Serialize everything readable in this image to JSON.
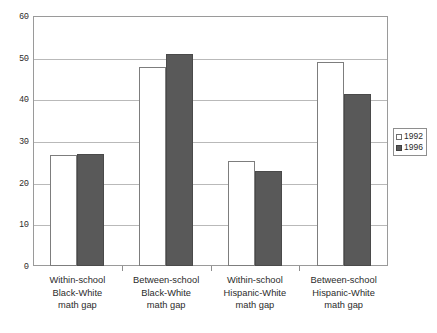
{
  "chart_data": {
    "type": "bar",
    "title": "",
    "subtitle": "",
    "xlabel": "",
    "ylabel": "",
    "ylim": [
      0,
      60
    ],
    "ytick_labels": [
      "60",
      "50",
      "40",
      "30",
      "20",
      "10",
      "0"
    ],
    "ytick_values": [
      60,
      50,
      40,
      30,
      20,
      10,
      0
    ],
    "grid": true,
    "legend_position": "right",
    "categories": [
      "Within-school Black-White math gap",
      "Between-school Black-White math gap",
      "Within-school Hispanic-White math gap",
      "Between-school Hispanic-White math gap"
    ],
    "category_lines": [
      [
        "Within-school",
        "Black-White",
        "math gap"
      ],
      [
        "Between-school",
        "Black-White",
        "math gap"
      ],
      [
        "Within-school",
        "Hispanic-White",
        "math gap"
      ],
      [
        "Between-school",
        "Hispanic-White",
        "math gap"
      ]
    ],
    "series": [
      {
        "name": "1992",
        "color": "#ffffff",
        "values": [
          26.6,
          47.7,
          25.2,
          48.9
        ]
      },
      {
        "name": "1996",
        "color": "#595959",
        "values": [
          26.9,
          50.8,
          22.8,
          41.3
        ]
      }
    ]
  },
  "legend": {
    "items": [
      {
        "label": "1992",
        "swatch": "hollow-square-swatch"
      },
      {
        "label": "1996",
        "swatch": "filled-square-swatch"
      }
    ]
  },
  "colors": {
    "series_1992": "#ffffff",
    "series_1996": "#595959",
    "gridline": "#b9b9b9",
    "axis": "#9a9a9a",
    "text": "#2b2b2b",
    "background": "#ffffff"
  }
}
